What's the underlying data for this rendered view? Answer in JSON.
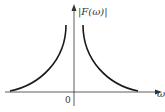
{
  "diagram": {
    "y_axis_label": "|F(ω)|",
    "x_axis_label": "ω",
    "origin_label": "0",
    "colors": {
      "curve": "#1a1a1a",
      "axis": "#333333"
    },
    "curves": [
      {
        "name": "left-branch",
        "description": "rises toward ω→0 from the left"
      },
      {
        "name": "right-branch",
        "description": "decays as ω increases"
      }
    ]
  }
}
